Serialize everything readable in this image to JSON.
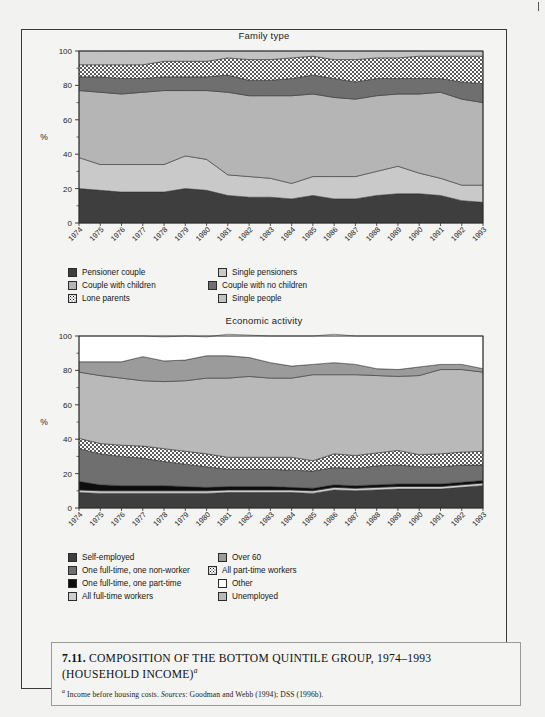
{
  "page": {
    "background_color": "#f2f2f0",
    "frame_color": "#3a3a3a"
  },
  "caption": {
    "number": "7.11.",
    "title": "COMPOSITION OF THE BOTTOM QUINTILE GROUP, 1974–1993 (HOUSEHOLD INCOME)",
    "title_superscript": "a",
    "note_marker": "a",
    "note_text_1": "Income before housing costs.",
    "note_sources_label": "Sources",
    "note_text_2": ": Goodman and Webb (1994); DSS (1996b)."
  },
  "chart_data": [
    {
      "type": "area",
      "title": "Family type",
      "xlabel": "",
      "ylabel": "%",
      "ylim": [
        0,
        100
      ],
      "yticks": [
        0,
        20,
        40,
        60,
        80,
        100
      ],
      "grid": false,
      "legend_position": "bottom",
      "categories": [
        "1974",
        "1975",
        "1976",
        "1977",
        "1978",
        "1979",
        "1980",
        "1981",
        "1982",
        "1983",
        "1984",
        "1985",
        "1986",
        "1987",
        "1988",
        "1989",
        "1990",
        "1991",
        "1992",
        "1993"
      ],
      "series": [
        {
          "name": "Pensioner couple",
          "color": "#3e3e3e",
          "pattern": "solid",
          "values": [
            20,
            19,
            18,
            18,
            18,
            20,
            19,
            16,
            15,
            15,
            14,
            16,
            14,
            14,
            16,
            17,
            17,
            16,
            13,
            12
          ]
        },
        {
          "name": "Single pensioners",
          "color": "#c9c9c9",
          "pattern": "solid",
          "values": [
            18,
            15,
            16,
            16,
            16,
            19,
            18,
            12,
            12,
            11,
            9,
            11,
            13,
            13,
            14,
            16,
            12,
            10,
            9,
            10
          ]
        },
        {
          "name": "Couple with children",
          "color": "#b5b5b5",
          "pattern": "solid",
          "values": [
            39,
            42,
            41,
            42,
            43,
            38,
            40,
            48,
            47,
            48,
            51,
            48,
            46,
            45,
            44,
            42,
            46,
            50,
            50,
            48
          ]
        },
        {
          "name": "Couple with no children",
          "color": "#6f6f6f",
          "pattern": "solid",
          "values": [
            8,
            9,
            9,
            8,
            8,
            8,
            8,
            10,
            9,
            9,
            10,
            11,
            11,
            10,
            10,
            9,
            9,
            8,
            10,
            11
          ]
        },
        {
          "name": "Lone parents",
          "color": "#ffffff",
          "pattern": "dots",
          "values": [
            7,
            7,
            8,
            8,
            9,
            9,
            9,
            10,
            12,
            12,
            12,
            11,
            11,
            13,
            12,
            12,
            13,
            13,
            15,
            16
          ]
        },
        {
          "name": "Single people",
          "color": "#c2c2c2",
          "pattern": "solid",
          "values": [
            8,
            8,
            8,
            8,
            6,
            6,
            6,
            4,
            5,
            5,
            4,
            3,
            5,
            5,
            4,
            4,
            3,
            3,
            3,
            3
          ]
        }
      ]
    },
    {
      "type": "area",
      "title": "Economic activity",
      "xlabel": "",
      "ylabel": "%",
      "ylim": [
        0,
        100
      ],
      "yticks": [
        0,
        20,
        40,
        60,
        80,
        100
      ],
      "grid": false,
      "legend_position": "bottom",
      "categories": [
        "1974",
        "1975",
        "1976",
        "1977",
        "1978",
        "1979",
        "1980",
        "1981",
        "1982",
        "1983",
        "1984",
        "1985",
        "1986",
        "1987",
        "1988",
        "1989",
        "1990",
        "1991",
        "1992",
        "1993"
      ],
      "series": [
        {
          "name": "Self-employed",
          "color": "#3e3e3e",
          "pattern": "solid",
          "values": [
            9,
            8.5,
            8.5,
            8.5,
            8.5,
            8.5,
            8.5,
            9,
            9,
            9,
            9,
            8.5,
            10.5,
            10,
            10.5,
            11,
            11,
            11,
            12,
            13
          ]
        },
        {
          "name": "All full-time workers",
          "color": "#cecece",
          "pattern": "solid",
          "values": [
            1.5,
            1.5,
            1.5,
            1.5,
            1.5,
            1.5,
            1.5,
            1.5,
            1.5,
            1.5,
            1.5,
            1.5,
            1.5,
            1.5,
            1.5,
            1.5,
            1.5,
            1.5,
            1.5,
            1.5
          ]
        },
        {
          "name": "One full-time, one part-time",
          "color": "#0d0d0d",
          "pattern": "solid",
          "values": [
            5,
            3.5,
            3,
            3,
            3,
            2.5,
            2,
            2,
            2,
            2,
            1.5,
            1.5,
            1.5,
            1.5,
            1.5,
            1.5,
            1.5,
            1.5,
            1.5,
            1.5
          ]
        },
        {
          "name": "One full-time, one non-worker",
          "color": "#6f6f6f",
          "pattern": "solid",
          "values": [
            19,
            18,
            17,
            16,
            14,
            13,
            12,
            10,
            10,
            10,
            10,
            10,
            10,
            10,
            11,
            11,
            10,
            10,
            10,
            9
          ]
        },
        {
          "name": "All part-time workers",
          "color": "#ffffff",
          "pattern": "dots",
          "values": [
            6,
            6,
            6.5,
            7,
            7.5,
            7.5,
            7.5,
            7,
            7,
            7,
            7.5,
            6,
            8,
            7.5,
            7.5,
            8.5,
            7,
            7.5,
            7.5,
            8
          ]
        },
        {
          "name": "Unemployed",
          "color": "#b9b9b9",
          "pattern": "solid",
          "values": [
            38.5,
            39.5,
            39,
            38,
            39,
            41,
            44,
            46,
            47,
            46,
            46,
            50,
            46,
            47,
            45,
            43,
            46,
            49,
            48,
            46
          ]
        },
        {
          "name": "Over 60",
          "color": "#9b9b9b",
          "pattern": "solid",
          "values": [
            6,
            8,
            9.5,
            14,
            12,
            12,
            13,
            13,
            11,
            9,
            7,
            6,
            7,
            6,
            4,
            4,
            5,
            3,
            3,
            2
          ]
        },
        {
          "name": "Other",
          "color": "#ffffff",
          "pattern": "solid",
          "values": [
            15,
            15,
            15,
            12,
            14,
            14,
            11,
            12.5,
            13,
            15.5,
            17.5,
            16.5,
            16.5,
            16.5,
            19,
            19.5,
            18,
            16.5,
            16.5,
            19
          ]
        }
      ],
      "legend_order": [
        "Self-employed",
        "Over 60",
        "One full-time, one non-worker",
        "All part-time workers",
        "One full-time, one part-time",
        "Other",
        "All full-time workers",
        "Unemployed"
      ]
    }
  ]
}
